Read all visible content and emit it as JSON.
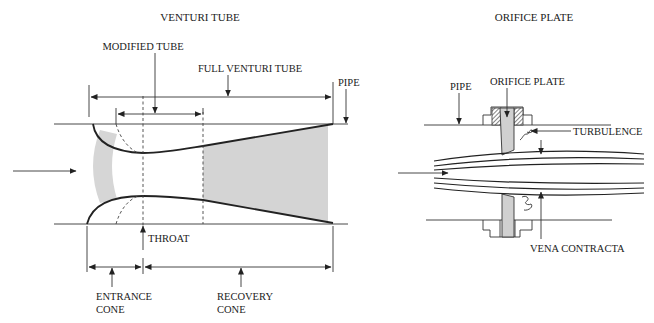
{
  "venturi": {
    "title": "VENTURI TUBE",
    "labels": {
      "modified_tube": "MODIFIED TUBE",
      "full_venturi_tube": "FULL VENTURI TUBE",
      "pipe": "PIPE",
      "throat": "THROAT",
      "entrance_cone_line1": "ENTRANCE",
      "entrance_cone_line2": "CONE",
      "recovery_cone_line1": "RECOVERY",
      "recovery_cone_line2": "CONE"
    }
  },
  "orifice": {
    "title": "ORIFICE PLATE",
    "labels": {
      "pipe": "PIPE",
      "orifice_plate": "ORIFICE PLATE",
      "turbulence": "TURBULENCE",
      "vena_contracta": "VENA CONTRACTA"
    }
  },
  "colors": {
    "line": "#222222",
    "shade": "#d4d4d4",
    "background": "#ffffff"
  }
}
